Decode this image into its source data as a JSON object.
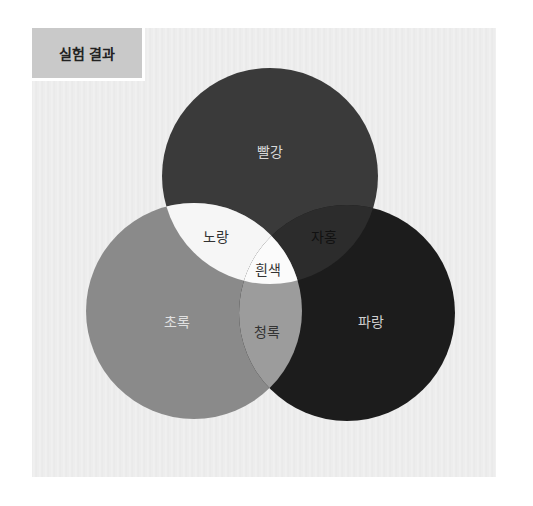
{
  "title": "실험 결과",
  "colors": {
    "red": "#3a3a3a",
    "green": "#8a8a8a",
    "blue": "#1c1c1c",
    "yellow": "#f6f6f6",
    "magenta": "#2c2c2c",
    "cyan": "#9c9c9c",
    "white": "#fbfbfb"
  },
  "regions": {
    "red": "빨강",
    "green": "초록",
    "blue": "파랑",
    "yellow": "노랑",
    "magenta": "자홍",
    "cyan": "청록",
    "white": "흰색"
  },
  "circles": [
    {
      "name": "red",
      "cx": 270,
      "cy": 176,
      "r": 108
    },
    {
      "name": "green",
      "cx": 194,
      "cy": 311,
      "r": 108
    },
    {
      "name": "blue",
      "cx": 347,
      "cy": 313,
      "r": 108
    }
  ]
}
